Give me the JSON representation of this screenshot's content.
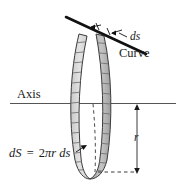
{
  "figure": {
    "labels": {
      "axis": "Axis",
      "curve": "Curve",
      "ds": "ds",
      "radius": "r"
    },
    "formula": {
      "lhs": "dS",
      "equals": "=",
      "coefficient": "2",
      "pi": "π",
      "radius": "r",
      "arc": "ds",
      "full": "dS = 2πr ds"
    },
    "colors": {
      "stroke": "#1a1a1a",
      "band_fill_light": "#d9d9d9",
      "band_fill_dark": "#b3b3b3",
      "axis_line": "#555555",
      "hatch": "#777777",
      "background": "#ffffff"
    },
    "geometry": {
      "axis_line_y": 103,
      "radius_dimension_top_y": 106,
      "radius_dimension_bottom_y": 172,
      "radius_dimension_x": 137,
      "band_center_x": 91,
      "band_top_y": 33,
      "band_bottom_y": 178
    }
  }
}
